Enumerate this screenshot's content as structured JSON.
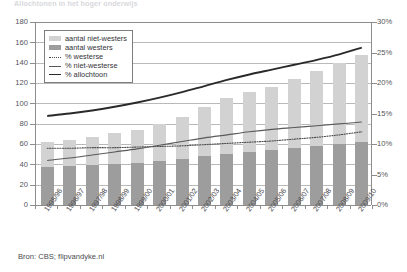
{
  "title": "Allochtonen in het hoger onderwijs",
  "source": "Bron: CBS; flipvandyke.nl",
  "legend": [
    {
      "label": "aantal niet-westers",
      "key": "swatch-light",
      "color": "#d2d2d2"
    },
    {
      "label": "aantal westers",
      "key": "swatch-dark",
      "color": "#9d9d9d"
    },
    {
      "label": "% westerse",
      "key": "line-dotted",
      "color": "#4a4a4a"
    },
    {
      "label": "% niet-westerse",
      "key": "line-thin",
      "color": "#5a5a5a"
    },
    {
      "label": "% allochtoon",
      "key": "line-thick",
      "color": "#2a2a2a"
    }
  ],
  "axes": {
    "left_ticks": [
      "180",
      "160",
      "140",
      "120",
      "100",
      "80",
      "60",
      "40",
      "20",
      "0"
    ],
    "right_ticks": [
      "30%",
      "25%",
      "20%",
      "15%",
      "10%",
      "5%",
      "0%"
    ]
  },
  "chart_data": {
    "type": "bar",
    "title": "Allochtonen in het hoger onderwijs",
    "xlabel": "",
    "ylabel": "",
    "ylim": [
      0,
      180
    ],
    "y2lim": [
      0,
      30
    ],
    "grid": true,
    "legend_position": "top-left",
    "categories": [
      "1995/96",
      "1996/97",
      "1997/98",
      "1998/99",
      "1999/00",
      "2000/01",
      "2001/02",
      "2002/03",
      "2003/04",
      "2004/05",
      "2005/06",
      "2006/07",
      "2007/08",
      "2008/09",
      "2009/10"
    ],
    "series": [
      {
        "name": "aantal westers",
        "type": "bar",
        "stack": "aantal",
        "axis": "left",
        "color": "#9d9d9d",
        "values": [
          37,
          38,
          39,
          40,
          41,
          43,
          45,
          48,
          50,
          52,
          54,
          56,
          58,
          60,
          62
        ]
      },
      {
        "name": "aantal niet-westers",
        "type": "bar",
        "stack": "aantal",
        "axis": "left",
        "color": "#d2d2d2",
        "values": [
          25,
          26,
          28,
          31,
          33,
          37,
          42,
          48,
          55,
          59,
          62,
          68,
          74,
          80,
          86
        ]
      },
      {
        "name": "% westerse",
        "type": "line",
        "style": "dotted",
        "axis": "right",
        "color": "#4a4a4a",
        "values": [
          9.3,
          9.3,
          9.4,
          9.4,
          9.5,
          9.6,
          9.7,
          9.9,
          10.1,
          10.3,
          10.5,
          10.8,
          11.1,
          11.5,
          12.0
        ]
      },
      {
        "name": "% niet-westerse",
        "type": "line",
        "style": "thin",
        "axis": "right",
        "color": "#5a5a5a",
        "values": [
          7.3,
          7.7,
          8.2,
          8.7,
          9.2,
          9.8,
          10.4,
          11.0,
          11.5,
          12.0,
          12.4,
          12.7,
          13.0,
          13.3,
          13.6
        ]
      },
      {
        "name": "% allochtoon",
        "type": "line",
        "style": "thick",
        "axis": "right",
        "color": "#2a2a2a",
        "values": [
          14.6,
          15.0,
          15.5,
          16.1,
          16.8,
          17.6,
          18.5,
          19.5,
          20.5,
          21.4,
          22.2,
          23.0,
          23.8,
          24.7,
          25.8
        ]
      }
    ],
    "totals": [
      62,
      64,
      67,
      71,
      74,
      80,
      87,
      96,
      105,
      111,
      116,
      124,
      132,
      140,
      148
    ]
  }
}
